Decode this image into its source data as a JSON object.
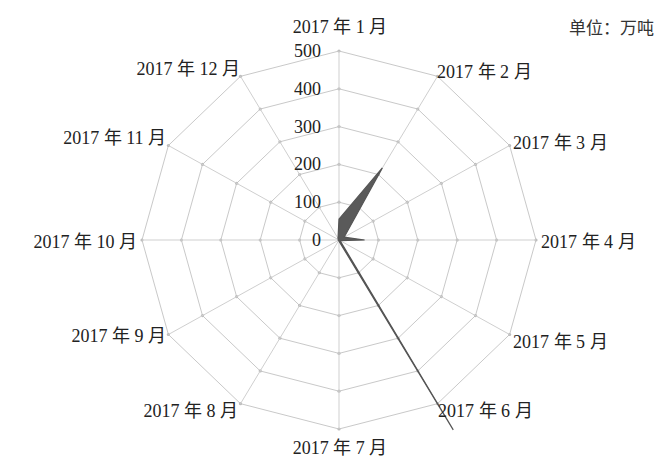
{
  "unit_label": "单位：万吨",
  "colors": {
    "grid": "#c9c9c9",
    "area": "#5a5a5a",
    "text": "#222222"
  },
  "chart_data": {
    "type": "radar",
    "title": "",
    "unit": "万吨",
    "categories": [
      "2017 年 1 月",
      "2017 年 2 月",
      "2017 年 3 月",
      "2017 年 4 月",
      "2017 年 5 月",
      "2017 年 6 月",
      "2017 年 7 月",
      "2017 年 8 月",
      "2017 年 9 月",
      "2017 年 10 月",
      "2017 年 11 月",
      "2017 年 12 月"
    ],
    "series": [
      {
        "name": "",
        "values": [
          55,
          220,
          15,
          65,
          3,
          580,
          3,
          2,
          2,
          2,
          2,
          5
        ]
      }
    ],
    "radial_ticks": [
      0,
      100,
      200,
      300,
      400,
      500
    ],
    "rlim": [
      0,
      500
    ],
    "grid": true,
    "legend": "none"
  }
}
